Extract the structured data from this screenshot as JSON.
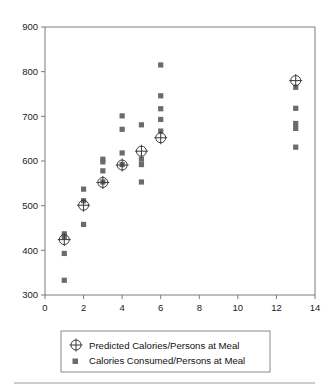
{
  "chart_data": {
    "type": "scatter",
    "title": "",
    "subtitle": "",
    "xlabel": "",
    "ylabel": "",
    "xlim": [
      0,
      14
    ],
    "ylim": [
      300,
      900
    ],
    "xticks": [
      0,
      2,
      4,
      6,
      8,
      10,
      12,
      14
    ],
    "yticks": [
      300,
      400,
      500,
      600,
      700,
      800,
      900
    ],
    "xtick_labels": [
      "0",
      "2",
      "4",
      "6",
      "8",
      "10",
      "12",
      "14"
    ],
    "ytick_labels": [
      "300",
      "400",
      "500",
      "600",
      "700",
      "800",
      "900"
    ],
    "grid": false,
    "legend_position": "below-plot",
    "series": [
      {
        "name": "Predicted Calories/Persons at Meal",
        "marker": "circle-plus",
        "color": "#3a3a3a",
        "points": [
          {
            "x": 1,
            "y": 424
          },
          {
            "x": 2,
            "y": 501
          },
          {
            "x": 3,
            "y": 552
          },
          {
            "x": 4,
            "y": 591
          },
          {
            "x": 5,
            "y": 622
          },
          {
            "x": 6,
            "y": 652
          },
          {
            "x": 13,
            "y": 780
          }
        ]
      },
      {
        "name": "Calories Consumed/Persons at Meal",
        "marker": "square",
        "color": "#6b6b6b",
        "points": [
          {
            "x": 1,
            "y": 437
          },
          {
            "x": 1,
            "y": 430
          },
          {
            "x": 1,
            "y": 393
          },
          {
            "x": 1,
            "y": 333
          },
          {
            "x": 2,
            "y": 537
          },
          {
            "x": 2,
            "y": 511
          },
          {
            "x": 2,
            "y": 458
          },
          {
            "x": 3,
            "y": 604
          },
          {
            "x": 3,
            "y": 598
          },
          {
            "x": 3,
            "y": 578
          },
          {
            "x": 3,
            "y": 553
          },
          {
            "x": 4,
            "y": 701
          },
          {
            "x": 4,
            "y": 671
          },
          {
            "x": 4,
            "y": 618
          },
          {
            "x": 4,
            "y": 592
          },
          {
            "x": 5,
            "y": 681
          },
          {
            "x": 5,
            "y": 604
          },
          {
            "x": 5,
            "y": 592
          },
          {
            "x": 5,
            "y": 553
          },
          {
            "x": 6,
            "y": 815
          },
          {
            "x": 6,
            "y": 746
          },
          {
            "x": 6,
            "y": 717
          },
          {
            "x": 6,
            "y": 693
          },
          {
            "x": 6,
            "y": 667
          },
          {
            "x": 13,
            "y": 765
          },
          {
            "x": 13,
            "y": 718
          },
          {
            "x": 13,
            "y": 684
          },
          {
            "x": 13,
            "y": 673
          },
          {
            "x": 13,
            "y": 631
          }
        ]
      }
    ]
  },
  "legend": {
    "items": [
      {
        "label": "Predicted Calories/Persons at Meal",
        "marker": "circle-plus-marker-icon"
      },
      {
        "label": "Calories Consumed/Persons at Meal",
        "marker": "square-marker-icon"
      }
    ]
  }
}
